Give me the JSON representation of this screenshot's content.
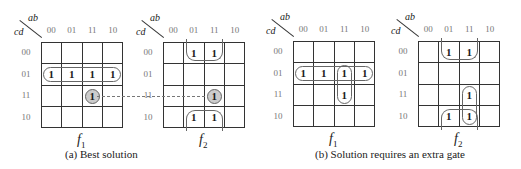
{
  "diagram": {
    "row_var": "cd",
    "col_var": "ab",
    "col_labels": [
      "00",
      "01",
      "11",
      "10"
    ],
    "row_labels": [
      "00",
      "01",
      "11",
      "10"
    ],
    "maps": [
      {
        "id": "a-f1",
        "function_name": "f",
        "function_subscript": "1",
        "cells": [
          [
            "",
            "",
            "",
            ""
          ],
          [
            "1",
            "1",
            "1",
            "1"
          ],
          [
            "",
            "",
            "1",
            ""
          ],
          [
            "",
            "",
            "",
            ""
          ]
        ],
        "shared_cell": {
          "row": 2,
          "col": 2
        }
      },
      {
        "id": "a-f2",
        "function_name": "f",
        "function_subscript": "2",
        "cells": [
          [
            "",
            "1",
            "1",
            ""
          ],
          [
            "",
            "",
            "",
            ""
          ],
          [
            "",
            "",
            "1",
            ""
          ],
          [
            "",
            "1",
            "1",
            ""
          ]
        ],
        "shared_cell": {
          "row": 2,
          "col": 2
        }
      },
      {
        "id": "b-f1",
        "function_name": "f",
        "function_subscript": "1",
        "cells": [
          [
            "",
            "",
            "",
            ""
          ],
          [
            "1",
            "1",
            "1",
            "1"
          ],
          [
            "",
            "",
            "1",
            ""
          ],
          [
            "",
            "",
            "",
            ""
          ]
        ]
      },
      {
        "id": "b-f2",
        "function_name": "f",
        "function_subscript": "2",
        "cells": [
          [
            "",
            "1",
            "1",
            ""
          ],
          [
            "",
            "",
            "",
            ""
          ],
          [
            "",
            "",
            "1",
            ""
          ],
          [
            "",
            "1",
            "1",
            ""
          ]
        ]
      }
    ],
    "captions": {
      "a": "(a)  Best solution",
      "b": "(b)  Solution requires an extra gate"
    }
  }
}
